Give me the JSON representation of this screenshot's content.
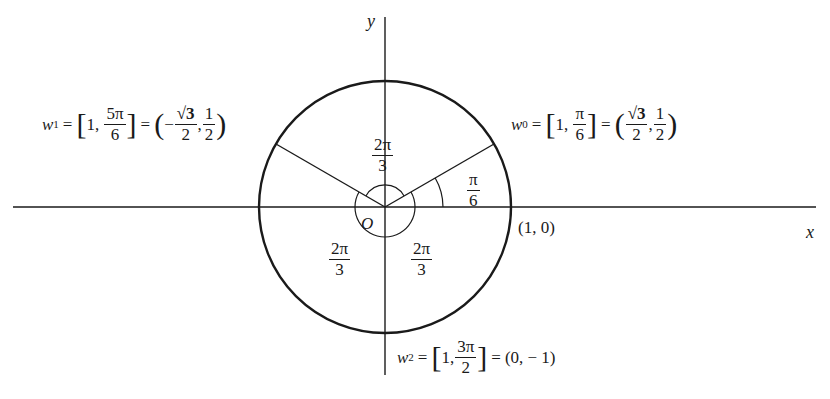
{
  "diagram": {
    "axes": {
      "x_label": "x",
      "y_label": "y"
    },
    "origin_label": "O",
    "point_1_0_label": "(1, 0)",
    "circle": {
      "center_px": [
        385,
        207
      ],
      "radius_px": 126,
      "radius": 1
    },
    "points": [
      {
        "name": "w0",
        "var": "w",
        "sub": "0",
        "polar_r": "1",
        "polar_angle_num": "π",
        "polar_angle_den": "6",
        "cart_x_num": "√3",
        "cart_x_den": "2",
        "cart_x_sign": "",
        "cart_y_num": "1",
        "cart_y_den": "2",
        "angle_deg": 30
      },
      {
        "name": "w1",
        "var": "w",
        "sub": "1",
        "polar_r": "1",
        "polar_angle_num": "5π",
        "polar_angle_den": "6",
        "cart_x_num": "√3",
        "cart_x_den": "2",
        "cart_x_sign": "−",
        "cart_y_num": "1",
        "cart_y_den": "2",
        "angle_deg": 150
      },
      {
        "name": "w2",
        "var": "w",
        "sub": "2",
        "polar_r": "1",
        "polar_angle_num": "3π",
        "polar_angle_den": "2",
        "cart": "(0, − 1)",
        "angle_deg": 270
      }
    ],
    "angle_labels": [
      {
        "id": "pi6",
        "num": "π",
        "den": "6"
      },
      {
        "id": "top",
        "num": "2π",
        "den": "3"
      },
      {
        "id": "lower_left",
        "num": "2π",
        "den": "3"
      },
      {
        "id": "lower_right",
        "num": "2π",
        "den": "3"
      }
    ],
    "colors": {
      "line": "#1a1a1a",
      "background": "#ffffff"
    }
  }
}
